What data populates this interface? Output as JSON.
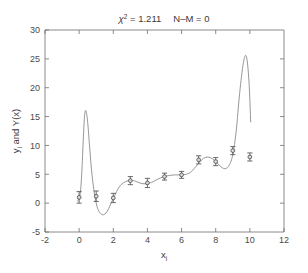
{
  "figure": {
    "width": 308,
    "height": 273,
    "background": "#ffffff",
    "axis_color": "#6d6d6d",
    "curve_color": "#8a8a8a",
    "marker_color": "#4a4a4a"
  },
  "title": {
    "chi_symbol": "χ",
    "chi_exponent": "2",
    "chi_equals": " = 1.211",
    "dof_text": "N–M = 0",
    "full": "χ² = 1.211    N–M = 0"
  },
  "chart_data": {
    "type": "line",
    "xlabel": "x_i",
    "ylabel": "y_i and Y(x)",
    "xlim": [
      -2,
      12
    ],
    "ylim": [
      -5,
      30
    ],
    "xticks": [
      -2,
      0,
      2,
      4,
      6,
      8,
      10,
      12
    ],
    "xticklabels": [
      "-2",
      "0",
      "2",
      "4",
      "6",
      "8",
      "10",
      "12"
    ],
    "yticks": [
      -5,
      0,
      5,
      10,
      15,
      20,
      25,
      30
    ],
    "yticklabels": [
      "-5",
      "0",
      "5",
      "10",
      "15",
      "20",
      "25",
      "30"
    ],
    "grid": false,
    "legend": null,
    "series": [
      {
        "name": "y_i",
        "type": "scatter-errorbar",
        "marker": "circle",
        "x": [
          0,
          1,
          2,
          3,
          4,
          5,
          6,
          7,
          8,
          9,
          10
        ],
        "y": [
          1.0,
          1.2,
          0.9,
          3.9,
          3.5,
          4.6,
          4.9,
          7.5,
          7.2,
          9.1,
          8.0
        ],
        "yerr": [
          1.0,
          0.9,
          0.8,
          0.7,
          0.8,
          0.6,
          0.6,
          0.7,
          0.7,
          0.7,
          0.7
        ]
      },
      {
        "name": "Y(x)",
        "type": "line",
        "x": [
          -0.1,
          0.05,
          0.15,
          0.25,
          0.32,
          0.4,
          0.5,
          0.62,
          0.75,
          0.9,
          1.05,
          1.2,
          1.35,
          1.5,
          1.65,
          1.8,
          1.95,
          2.1,
          2.3,
          2.5,
          2.7,
          2.9,
          3.1,
          3.3,
          3.55,
          3.8,
          4.0,
          4.25,
          4.5,
          4.75,
          5.0,
          5.3,
          5.6,
          5.9,
          6.2,
          6.5,
          6.8,
          7.05,
          7.3,
          7.55,
          7.8,
          8.0,
          8.2,
          8.4,
          8.6,
          8.8,
          9.0,
          9.2,
          9.4,
          9.62,
          9.8,
          9.95,
          10.05
        ],
        "y": [
          0.3,
          1.4,
          5.0,
          11.5,
          15.2,
          16.0,
          14.0,
          9.5,
          5.0,
          1.6,
          -0.6,
          -1.6,
          -2.0,
          -1.9,
          -1.4,
          -0.5,
          0.5,
          1.4,
          2.6,
          3.3,
          3.7,
          3.9,
          3.95,
          3.8,
          3.5,
          3.35,
          3.4,
          3.6,
          4.0,
          4.35,
          4.6,
          4.8,
          4.9,
          4.9,
          4.95,
          5.3,
          6.2,
          7.1,
          7.8,
          8.0,
          7.7,
          7.2,
          6.6,
          6.1,
          6.0,
          6.6,
          8.4,
          12.5,
          19.0,
          24.3,
          25.4,
          21.0,
          14.0
        ]
      }
    ]
  }
}
